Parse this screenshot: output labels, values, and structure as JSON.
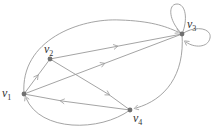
{
  "diagram": {
    "type": "directed-graph",
    "colors": {
      "edge": "#9a9a9a",
      "node": "#707070",
      "label": "#333333"
    },
    "nodes": [
      {
        "id": "v1",
        "label": "v",
        "sub": "1",
        "x": 24,
        "y": 94,
        "lx": 2,
        "ly": 88
      },
      {
        "id": "v2",
        "label": "v",
        "sub": "2",
        "x": 50,
        "y": 59,
        "lx": 44,
        "ly": 43
      },
      {
        "id": "v3",
        "label": "v",
        "sub": "3",
        "x": 182,
        "y": 34,
        "lx": 187,
        "ly": 19
      },
      {
        "id": "v4",
        "label": "v",
        "sub": "4",
        "x": 130,
        "y": 110,
        "lx": 133,
        "ly": 113
      }
    ],
    "edges": [
      {
        "from": "v1",
        "to": "v2"
      },
      {
        "from": "v1",
        "to": "v3"
      },
      {
        "from": "v2",
        "to": "v3"
      },
      {
        "from": "v2",
        "to": "v4"
      },
      {
        "from": "v4",
        "to": "v1"
      },
      {
        "from": "v1",
        "to": "v3",
        "curve": "top-arc"
      },
      {
        "from": "v3",
        "to": "v4",
        "curve": "right-arc"
      },
      {
        "from": "v4",
        "to": "v1",
        "curve": "bottom-arc"
      },
      {
        "from": "v3",
        "to": "v3",
        "loop": "up"
      },
      {
        "from": "v3",
        "to": "v3",
        "loop": "right"
      }
    ]
  }
}
